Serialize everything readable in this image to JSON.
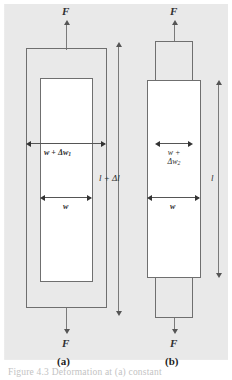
{
  "figure": {
    "kind": "mechanics-deformation-diagram",
    "background_color": "#e9e9e9",
    "line_color": "#6f6f6f",
    "caption": "Figure 4.3  Deformation at (a) constant"
  },
  "panel_a": {
    "key": "a",
    "label": "(a)",
    "force_top_label": "F",
    "force_bottom_label": "F",
    "width_deformed_label_main": "w + Δw",
    "width_deformed_label_sub": "1",
    "width_original_label": "w"
  },
  "panel_b": {
    "key": "b",
    "label": "(b)",
    "force_top_label": "F",
    "force_bottom_label": "F",
    "width_deformed_label_line1": "w +",
    "width_deformed_label_line2_main": "Δw",
    "width_deformed_label_line2_sub": "2",
    "width_original_label": "w"
  },
  "dimensions": {
    "length_deformed_label_main": "l + Δl",
    "length_original_label": "l"
  }
}
